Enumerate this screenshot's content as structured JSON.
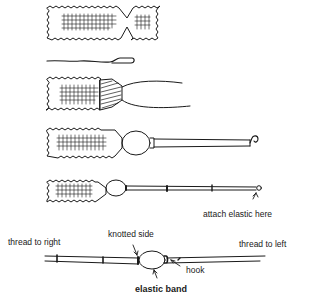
{
  "diagram": {
    "steps": [
      {
        "id": 1,
        "description": "fabric strip pinched in the middle"
      },
      {
        "id": 2,
        "description": "hook wire"
      },
      {
        "id": 3,
        "description": "fabric gathered and wrapped with thread, loose ends"
      },
      {
        "id": 4,
        "description": "bead and rod with hook at end"
      },
      {
        "id": 5,
        "description": "bead and segmented rod with loop at end"
      },
      {
        "id": 6,
        "description": "joined threads with elastic band"
      }
    ],
    "labels": {
      "attach_elastic": "attach elastic here",
      "thread_to_right": "thread to right",
      "knotted_side": "knotted side",
      "thread_to_left": "thread to left",
      "hook": "hook",
      "elastic_band": "elastic band"
    },
    "colors": {
      "ink": "#1a1a1a",
      "background": "#ffffff"
    }
  }
}
